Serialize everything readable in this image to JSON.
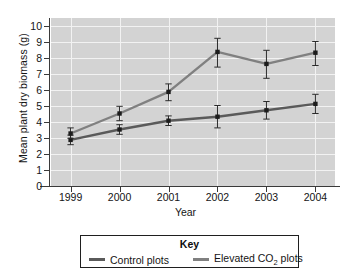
{
  "chart_data": {
    "type": "line",
    "title": "",
    "xlabel": "Year",
    "ylabel": "Mean plant dry biomass (g)",
    "categories": [
      "1999",
      "2000",
      "2001",
      "2002",
      "2003",
      "2004"
    ],
    "x": [
      1999,
      2000,
      2001,
      2002,
      2003,
      2004
    ],
    "xlim": [
      1998.6,
      2004.4
    ],
    "ylim": [
      0,
      10.5
    ],
    "yticks": [
      0,
      1,
      2,
      3,
      4,
      5,
      6,
      7,
      8,
      9,
      10
    ],
    "ytick_labels": [
      "0",
      "1",
      "2",
      "3",
      "4",
      "5",
      "6",
      "7",
      "8",
      "9",
      "10"
    ],
    "grid": true,
    "grid_color": "#f2f2f2",
    "plot_background": "#d3d3d3",
    "legend_position": "below-boxed",
    "legend_title": "Key",
    "error_bars": true,
    "series": [
      {
        "name": "Control plots",
        "color": "#5a5a5a",
        "marker": "square",
        "values": [
          2.85,
          3.5,
          4.05,
          4.3,
          4.7,
          5.1
        ],
        "err_low": [
          2.55,
          3.2,
          3.75,
          3.6,
          4.15,
          4.5
        ],
        "err_high": [
          3.15,
          3.8,
          4.35,
          5.0,
          5.25,
          5.7
        ]
      },
      {
        "name": "Elevated CO2 plots",
        "color": "#808080",
        "marker": "square",
        "values": [
          3.25,
          4.5,
          5.85,
          8.35,
          7.6,
          8.3
        ],
        "err_low": [
          2.95,
          4.05,
          5.3,
          7.4,
          6.7,
          7.5
        ],
        "err_high": [
          3.6,
          4.95,
          6.35,
          9.2,
          8.45,
          9.0
        ]
      }
    ]
  },
  "axes": {
    "y_title": "Mean plant dry biomass (g)",
    "x_title": "Year"
  },
  "legend": {
    "title": "Key",
    "items": [
      {
        "label": "Control plots",
        "color": "#5a5a5a"
      },
      {
        "label_prefix": "Elevated CO",
        "label_sub": "2",
        "label_suffix": " plots",
        "color": "#808080"
      }
    ]
  }
}
